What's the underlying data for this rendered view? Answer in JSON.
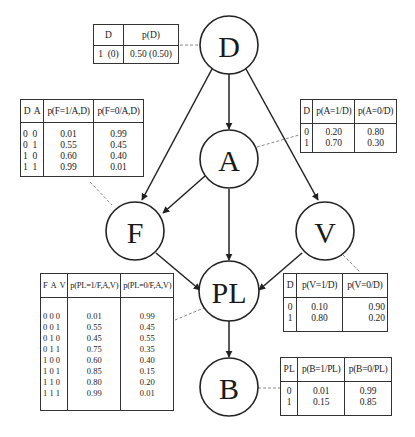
{
  "nodes": {
    "D": {
      "label": "D"
    },
    "A": {
      "label": "A"
    },
    "F": {
      "label": "F"
    },
    "V": {
      "label": "V"
    },
    "PL": {
      "label": "PL"
    },
    "B": {
      "label": "B"
    }
  },
  "edges": [
    {
      "from": "D",
      "to": "A"
    },
    {
      "from": "D",
      "to": "F"
    },
    {
      "from": "D",
      "to": "V"
    },
    {
      "from": "A",
      "to": "F"
    },
    {
      "from": "A",
      "to": "PL"
    },
    {
      "from": "F",
      "to": "PL"
    },
    {
      "from": "V",
      "to": "PL"
    },
    {
      "from": "PL",
      "to": "B"
    }
  ],
  "tables": {
    "D": {
      "headers": [
        "D",
        "p(D)"
      ],
      "rows": [
        [
          "1  (0)",
          "0.50 (0.50)"
        ]
      ]
    },
    "F": {
      "headers": [
        "D  A",
        "p(F=1/A,D)",
        "p(F=0/A,D)"
      ],
      "keys": [
        "0  0",
        "0  1",
        "1  0",
        "1  1"
      ],
      "p1": [
        "0.01",
        "0.55",
        "0.60",
        "0.99"
      ],
      "p0": [
        "0.99",
        "0.45",
        "0.40",
        "0.01"
      ]
    },
    "A": {
      "headers": [
        "D",
        "p(A=1/D)",
        "p(A=0/D)"
      ],
      "keys": [
        "0",
        "1"
      ],
      "p1": [
        "0.20",
        "0.70"
      ],
      "p0": [
        "0.80",
        "0.30"
      ]
    },
    "PL": {
      "headers": [
        "F  A  V",
        "p(PL=1/F,A,V)",
        "p(PL=0/F,A,V)"
      ],
      "keys": [
        "0 0 0",
        "0 0 1",
        "0 1 0",
        "0 1 1",
        "1 0 0",
        "1 0 1",
        "1 1 0",
        "1 1 1"
      ],
      "p1": [
        "0.01",
        "0.55",
        "0.45",
        "0.75",
        "0.60",
        "0.85",
        "0.80",
        "0.99"
      ],
      "p0": [
        "0.99",
        "0.45",
        "0.55",
        "0.35",
        "0.40",
        "0.15",
        "0.20",
        "0.01"
      ]
    },
    "V": {
      "headers": [
        "D",
        "p(V=1/D)",
        "p(V=0/D)"
      ],
      "keys": [
        "0",
        "1"
      ],
      "p1": [
        "0.10",
        "0.80"
      ],
      "p0": [
        "0.90",
        "0.20"
      ]
    },
    "B": {
      "headers": [
        "PL",
        "p(B=1/PL)",
        "p(B=0/PL)"
      ],
      "keys": [
        "0",
        "1"
      ],
      "p1": [
        "0.01",
        "0.15"
      ],
      "p0": [
        "0.99",
        "0.85"
      ]
    }
  },
  "colors": {
    "stroke": "#222222",
    "background": "#ffffff",
    "leader": "#888888"
  }
}
